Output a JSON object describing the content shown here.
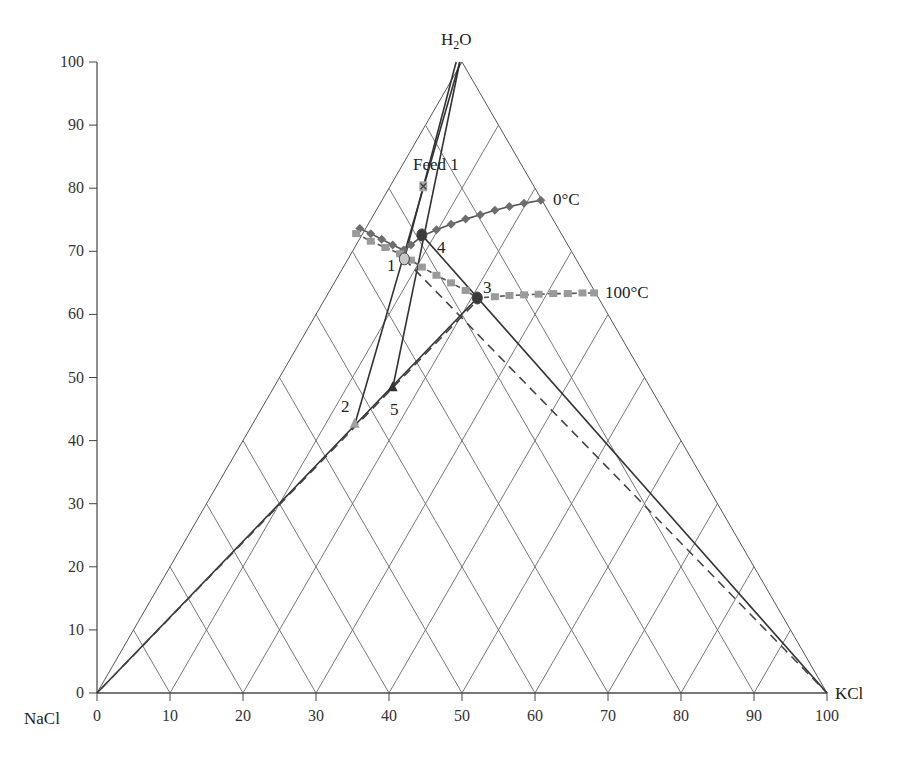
{
  "chart_data": {
    "type": "ternary-phase-diagram",
    "title": "",
    "components": {
      "top": "H2O",
      "left": "NaCl",
      "right": "KCl"
    },
    "xlabel": "",
    "ylabel": "",
    "xlim": [
      0,
      100
    ],
    "ylim": [
      0,
      100
    ],
    "x_ticks": [
      0,
      10,
      20,
      30,
      40,
      50,
      60,
      70,
      80,
      90,
      100
    ],
    "y_ticks": [
      0,
      10,
      20,
      30,
      40,
      50,
      60,
      70,
      80,
      90,
      100
    ],
    "grid": "ternary diamond grid at 10% spacing",
    "isotherms": [
      {
        "name": "0°C",
        "label": "0°C",
        "marker": "diamond",
        "color": "#6e6e6e",
        "points": [
          [
            36.0,
            73.6
          ],
          [
            37.5,
            72.8
          ],
          [
            39.0,
            71.9
          ],
          [
            40.5,
            71.0
          ],
          [
            42.0,
            70.2
          ],
          [
            43.0,
            71.0
          ],
          [
            44.5,
            72.4
          ],
          [
            46.5,
            73.4
          ],
          [
            48.5,
            74.3
          ],
          [
            50.5,
            75.1
          ],
          [
            52.5,
            75.8
          ],
          [
            54.5,
            76.5
          ],
          [
            56.5,
            77.1
          ],
          [
            58.5,
            77.6
          ],
          [
            60.8,
            78.1
          ]
        ]
      },
      {
        "name": "100°C",
        "label": "100°C",
        "marker": "square",
        "color": "#9a9a9a",
        "points": [
          [
            35.5,
            72.8
          ],
          [
            37.5,
            71.6
          ],
          [
            39.5,
            70.6
          ],
          [
            41.5,
            69.6
          ],
          [
            43.0,
            68.6
          ],
          [
            44.5,
            67.5
          ],
          [
            46.5,
            66.2
          ],
          [
            48.5,
            65.0
          ],
          [
            50.5,
            63.8
          ],
          [
            52.1,
            62.6
          ],
          [
            54.5,
            62.8
          ],
          [
            56.5,
            63.0
          ],
          [
            58.5,
            63.1
          ],
          [
            60.5,
            63.2
          ],
          [
            62.5,
            63.3
          ],
          [
            64.5,
            63.3
          ],
          [
            66.5,
            63.4
          ],
          [
            68.1,
            63.4
          ]
        ]
      }
    ],
    "points": [
      {
        "label": "Feed 1",
        "x": 44.7,
        "y": 80.3,
        "marker": "x-square"
      },
      {
        "label": "1",
        "x": 42.1,
        "y": 68.8,
        "marker": "circle"
      },
      {
        "label": "2",
        "x": 35.3,
        "y": 42.5,
        "marker": "triangle"
      },
      {
        "label": "3",
        "x": 52.1,
        "y": 62.6,
        "marker": "circle"
      },
      {
        "label": "4",
        "x": 44.5,
        "y": 72.6,
        "marker": "circle"
      },
      {
        "label": "5",
        "x": 40.5,
        "y": 48.3,
        "marker": "triangle"
      }
    ],
    "tie_lines": [
      {
        "from": [
          49.7,
          100
        ],
        "to": [
          35.3,
          42.5
        ],
        "style": "solid"
      },
      {
        "from": [
          49.7,
          100
        ],
        "to": [
          40.5,
          48.3
        ],
        "style": "solid"
      },
      {
        "from": [
          49.2,
          100
        ],
        "to": [
          42.1,
          68.8
        ],
        "style": "solid"
      },
      {
        "from": [
          44.5,
          72.6
        ],
        "to": [
          100,
          0
        ],
        "style": "solid"
      },
      {
        "from": [
          42.1,
          68.8
        ],
        "to": [
          100,
          0
        ],
        "style": "dashed"
      },
      {
        "from": [
          52.1,
          62.6
        ],
        "to": [
          0,
          0
        ],
        "style": "solid"
      },
      {
        "from": [
          51.5,
          61.5
        ],
        "to": [
          0,
          0
        ],
        "style": "dashed"
      }
    ]
  },
  "labels": {
    "top": "H",
    "top_sub": "2",
    "top_end": "O",
    "left": "NaCl",
    "right": "KCl",
    "feed": "Feed 1",
    "p1": "1",
    "p2": "2",
    "p3": "3",
    "p4": "4",
    "p5": "5",
    "iso0": "0°C",
    "iso100": "100°C"
  },
  "ticks": {
    "y": [
      "100",
      "90",
      "80",
      "70",
      "60",
      "50",
      "40",
      "30",
      "20",
      "10",
      "0"
    ],
    "x": [
      "0",
      "10",
      "20",
      "30",
      "40",
      "50",
      "60",
      "70",
      "80",
      "90",
      "100"
    ]
  }
}
